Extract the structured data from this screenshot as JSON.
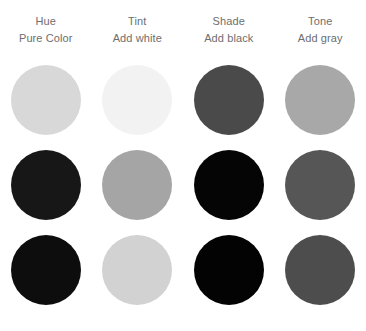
{
  "diagram": {
    "background_color": "#ffffff",
    "label_color": "#6e6e6e",
    "columns": [
      {
        "title": "Hue",
        "subtitle": "Pure Color"
      },
      {
        "title": "Tint",
        "subtitle": "Add white"
      },
      {
        "title": "Shade",
        "subtitle": "Add black"
      },
      {
        "title": "Tone",
        "subtitle": "Add gray"
      }
    ],
    "rows": [
      {
        "swatches": [
          {
            "column": "Hue",
            "color": "#d8d8d8"
          },
          {
            "column": "Tint",
            "color": "#f2f2f2"
          },
          {
            "column": "Shade",
            "color": "#4a4a4a"
          },
          {
            "column": "Tone",
            "color": "#a8a8a8"
          }
        ]
      },
      {
        "swatches": [
          {
            "column": "Hue",
            "color": "#171717"
          },
          {
            "column": "Tint",
            "color": "#a5a5a5"
          },
          {
            "column": "Shade",
            "color": "#050505"
          },
          {
            "column": "Tone",
            "color": "#565656"
          }
        ]
      },
      {
        "swatches": [
          {
            "column": "Hue",
            "color": "#0d0d0d"
          },
          {
            "column": "Tint",
            "color": "#d2d2d2"
          },
          {
            "column": "Shade",
            "color": "#030303"
          },
          {
            "column": "Tone",
            "color": "#4d4d4d"
          }
        ]
      }
    ]
  }
}
